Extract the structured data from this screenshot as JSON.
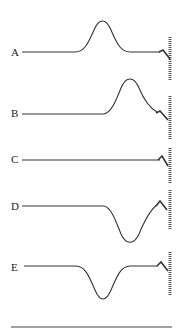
{
  "diagram": {
    "options": [
      {
        "label": "A",
        "shape": "upward pulse, middle of string",
        "y": 52
      },
      {
        "label": "B",
        "shape": "upward pulse near wall, distorted",
        "y": 113
      },
      {
        "label": "C",
        "shape": "flat string",
        "y": 162
      },
      {
        "label": "D",
        "shape": "inverted pulse near wall",
        "y": 205
      },
      {
        "label": "E",
        "shape": "inverted pulse, middle of string",
        "y": 267
      }
    ]
  }
}
